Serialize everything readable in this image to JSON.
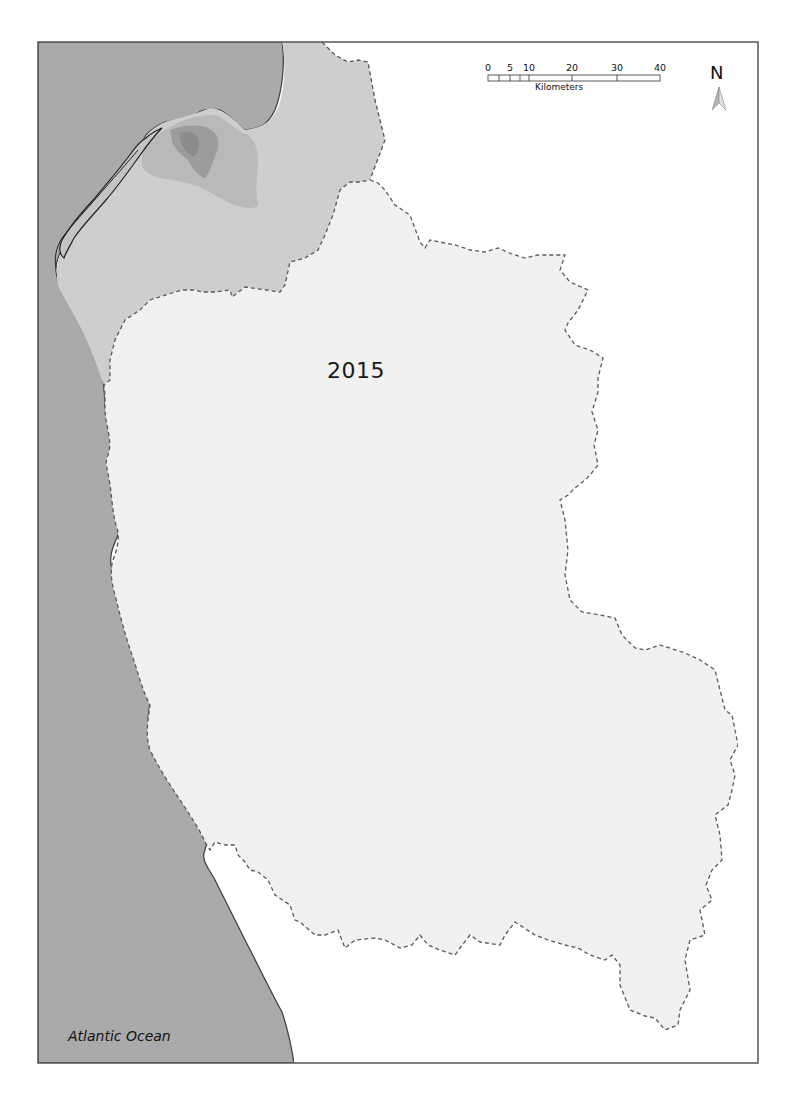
{
  "map": {
    "year_label": "2015",
    "ocean_label": "Atlantic Ocean",
    "colors": {
      "ocean": "#a9a9a9",
      "northern_district": "#cfcfcf",
      "development_light": "#b8b8b8",
      "development_dark": "#999999",
      "main_district": "#f3f3f3",
      "background": "#ffffff",
      "boundary_dashed": "#555555",
      "coastline": "#333333",
      "frame": "#555555"
    }
  },
  "scale_bar": {
    "ticks": [
      {
        "label": "0",
        "km": 0
      },
      {
        "label": "5",
        "km": 5
      },
      {
        "label": "10",
        "km": 10
      },
      {
        "label": "20",
        "km": 20
      },
      {
        "label": "30",
        "km": 30
      },
      {
        "label": "40",
        "km": 40
      }
    ],
    "unit": "Kilometers"
  },
  "north_arrow": {
    "letter": "N",
    "icon": "north-arrow-icon"
  }
}
